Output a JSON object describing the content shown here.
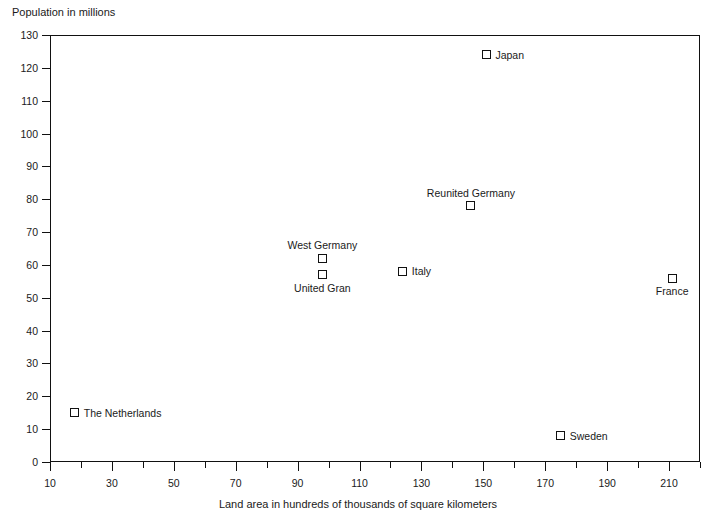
{
  "chart_data": {
    "type": "scatter",
    "title": "",
    "ylabel": "Population in millions",
    "xlabel": "Land area in hundreds of thousands of square kilometers",
    "xlim": [
      10,
      220
    ],
    "ylim": [
      0,
      130
    ],
    "grid": false,
    "legend": "none",
    "x_major_step": 20,
    "x_minor_step": 10,
    "y_major_step": 10,
    "y_tick_labels": [
      "0",
      "10",
      "20",
      "30",
      "40",
      "50",
      "60",
      "70",
      "80",
      "90",
      "100",
      "110",
      "120",
      "130"
    ],
    "x_tick_labels": [
      "10",
      "30",
      "50",
      "70",
      "90",
      "110",
      "130",
      "150",
      "170",
      "190",
      "210"
    ],
    "x_minor_ticks": [
      20,
      40,
      60,
      80,
      100,
      120,
      140,
      160,
      180,
      200,
      220
    ],
    "points": [
      {
        "name": "Japan",
        "x": 151,
        "y": 124,
        "label_pos": "right"
      },
      {
        "name": "Reunited Germany",
        "x": 146,
        "y": 78,
        "label_pos": "above"
      },
      {
        "name": "West Germany",
        "x": 98,
        "y": 62,
        "label_pos": "above"
      },
      {
        "name": "United Gran",
        "x": 98,
        "y": 57,
        "label_pos": "below"
      },
      {
        "name": "Italy",
        "x": 124,
        "y": 58,
        "label_pos": "right"
      },
      {
        "name": "France",
        "x": 211,
        "y": 56,
        "label_pos": "below"
      },
      {
        "name": "The Netherlands",
        "x": 18,
        "y": 15,
        "label_pos": "right"
      },
      {
        "name": "Sweden",
        "x": 175,
        "y": 8,
        "label_pos": "right"
      }
    ],
    "point_labels": {
      "japan": "Japan",
      "reunited_germany": "Reunited Germany",
      "west_germany": "West Germany",
      "united_kingdom": "United Kingdom",
      "italy": "Italy",
      "france": "France",
      "netherlands": "The Netherlands",
      "sweden": "Sweden"
    },
    "colors": {
      "axis": "#111111",
      "marker_stroke": "#111111",
      "marker_fill": "#ffffff",
      "text": "#1a1a1a",
      "background": "#ffffff"
    }
  }
}
